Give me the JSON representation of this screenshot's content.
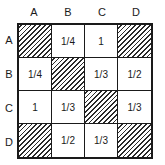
{
  "grid": {
    "column_headers": [
      "A",
      "B",
      "C",
      "D"
    ],
    "row_headers": [
      "A",
      "B",
      "C",
      "D"
    ],
    "rows": [
      {
        "label": "A",
        "cells": [
          {
            "value": "",
            "hatched": true
          },
          {
            "value": "1/4",
            "hatched": false
          },
          {
            "value": "1",
            "hatched": false
          },
          {
            "value": "",
            "hatched": true
          }
        ]
      },
      {
        "label": "B",
        "cells": [
          {
            "value": "1/4",
            "hatched": false
          },
          {
            "value": "",
            "hatched": true
          },
          {
            "value": "1/3",
            "hatched": false
          },
          {
            "value": "1/2",
            "hatched": false
          }
        ]
      },
      {
        "label": "C",
        "cells": [
          {
            "value": "1",
            "hatched": false
          },
          {
            "value": "1/3",
            "hatched": false
          },
          {
            "value": "",
            "hatched": true
          },
          {
            "value": "1/3",
            "hatched": false
          }
        ]
      },
      {
        "label": "D",
        "cells": [
          {
            "value": "",
            "hatched": true
          },
          {
            "value": "1/2",
            "hatched": false
          },
          {
            "value": "1/3",
            "hatched": false
          },
          {
            "value": "",
            "hatched": true
          }
        ]
      }
    ]
  },
  "colors": {
    "line": "#1a1a1a",
    "background": "#ffffff",
    "hatch": "#2a2a2a"
  }
}
